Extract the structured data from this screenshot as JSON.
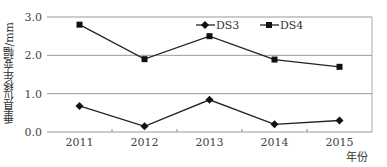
{
  "chart_data": {
    "type": "line",
    "title": "",
    "xlabel": "年份",
    "ylabel": "垂直位移年变幅/mm",
    "categories": [
      "2011",
      "2012",
      "2013",
      "2014",
      "2015"
    ],
    "series": [
      {
        "name": "DS3",
        "marker": "diamond",
        "values": [
          0.68,
          0.15,
          0.84,
          0.2,
          0.3
        ]
      },
      {
        "name": "DS4",
        "marker": "square",
        "values": [
          2.8,
          1.9,
          2.5,
          1.89,
          1.7
        ]
      }
    ],
    "ylim": [
      0.0,
      3.0
    ],
    "yticks": [
      "0.0",
      "1.0",
      "2.0",
      "3.0"
    ],
    "grid": true,
    "legend_position": "top-right-inside",
    "colors": {
      "line": "#222222",
      "grid": "#999999",
      "axis": "#777777"
    }
  }
}
